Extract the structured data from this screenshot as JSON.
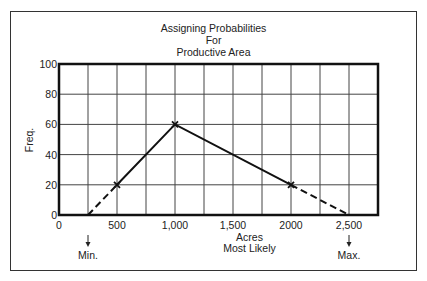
{
  "chart_data": {
    "type": "line",
    "title_lines": [
      "Assigning Probabilities",
      "For",
      "Productive Area"
    ],
    "xlabel": "Acres",
    "xlabel_sub": "Most Likely",
    "ylabel": "Freq.",
    "xlim": [
      0,
      2750
    ],
    "ylim": [
      0,
      100
    ],
    "grid": true,
    "x_ticks": [
      0,
      500,
      1000,
      1500,
      2000,
      2500
    ],
    "x_tick_labels": [
      "0",
      "500",
      "1,000",
      "1,500",
      "2000",
      "2,500"
    ],
    "y_ticks": [
      0,
      20,
      40,
      60,
      80,
      100
    ],
    "y_tick_labels": [
      "0",
      "20",
      "40",
      "60",
      "80",
      "100"
    ],
    "series": [
      {
        "name": "solid",
        "style": "solid",
        "x": [
          500,
          1000,
          2000
        ],
        "y": [
          20,
          60,
          20
        ]
      },
      {
        "name": "extrapolated-low",
        "style": "dashed",
        "x": [
          250,
          500
        ],
        "y": [
          0,
          20
        ]
      },
      {
        "name": "extrapolated-high",
        "style": "dashed",
        "x": [
          2000,
          2500
        ],
        "y": [
          20,
          0
        ]
      }
    ],
    "markers": [
      {
        "x": 500,
        "y": 20
      },
      {
        "x": 1000,
        "y": 60
      },
      {
        "x": 2000,
        "y": 20
      }
    ],
    "annotations": [
      {
        "label": "Min.",
        "x": 250,
        "arrow": "down"
      },
      {
        "label": "Max.",
        "x": 2500,
        "arrow": "down"
      }
    ]
  }
}
